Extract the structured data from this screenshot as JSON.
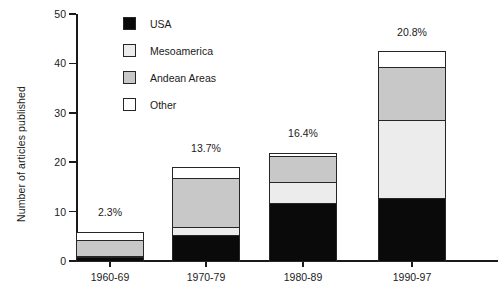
{
  "chart_data": {
    "type": "bar",
    "subtype": "stacked",
    "title": "",
    "xlabel": "",
    "ylabel": "Number of articles published",
    "categories": [
      "1960-69",
      "1970-79",
      "1980-89",
      "1990-97"
    ],
    "ylim": [
      0,
      50
    ],
    "yticks": [
      0,
      10,
      20,
      30,
      40,
      50
    ],
    "grid": false,
    "legend_position": "upper-left-inside",
    "series": [
      {
        "name": "USA",
        "color": "#0a0a0a",
        "values": [
          1.0,
          5.5,
          12.0,
          13.0
        ]
      },
      {
        "name": "Mesoamerica",
        "color": "#ececec",
        "values": [
          0.5,
          2.0,
          4.5,
          16.0
        ]
      },
      {
        "name": "Andean Areas",
        "color": "#c8c8c8",
        "values": [
          3.5,
          10.0,
          5.5,
          11.0
        ]
      },
      {
        "name": "Other",
        "color": "#ffffff",
        "values": [
          2.0,
          2.5,
          1.0,
          3.5
        ]
      }
    ],
    "totals": [
      7.0,
      20.0,
      23.0,
      43.5
    ],
    "annotations": [
      {
        "category": "1960-69",
        "text": "2.3%"
      },
      {
        "category": "1970-79",
        "text": "13.7%"
      },
      {
        "category": "1980-89",
        "text": "16.4%"
      },
      {
        "category": "1990-97",
        "text": "20.8%"
      }
    ]
  },
  "axis": {
    "y_title": "Number of articles published",
    "y_ticks": [
      "0",
      "10",
      "20",
      "30",
      "40",
      "50"
    ],
    "x_labels": [
      "1960-69",
      "1970-79",
      "1980-89",
      "1990-97"
    ]
  },
  "legend": {
    "items": [
      {
        "label": "USA"
      },
      {
        "label": "Mesoamerica"
      },
      {
        "label": "Andean Areas"
      },
      {
        "label": "Other"
      }
    ]
  },
  "annotations": {
    "bar1": "2.3%",
    "bar2": "13.7%",
    "bar3": "16.4%",
    "bar4": "20.8%"
  }
}
